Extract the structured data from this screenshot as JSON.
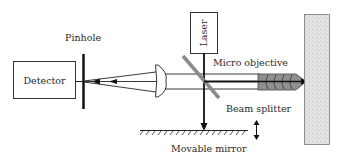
{
  "diagram": {
    "labels": {
      "pinhole": "Pinhole",
      "detector": "Detector",
      "laser": "Laser",
      "micro_objective": "Micro objective",
      "beam_splitter": "Beam splitter",
      "movable_mirror": "Movable mirror"
    },
    "colors": {
      "line": "#1a1a1a",
      "beam_splitter": "#8a8a8a",
      "objective_fill": "#8f8f8f",
      "sample_fill": "#d9d9d9"
    }
  }
}
